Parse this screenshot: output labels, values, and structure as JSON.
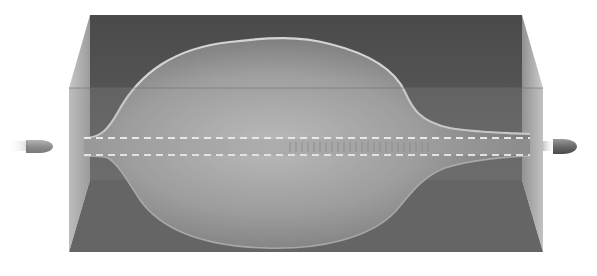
{
  "figure": {
    "elements": {
      "gel_block": "ballistic-gel-block",
      "temporary_cavity": "temporary-cavity-outline",
      "permanent_channel": "permanent-wound-channel",
      "bullet_entry": "bullet-entering",
      "bullet_exit": "bullet-exiting"
    },
    "colors": {
      "background": "#ffffff",
      "block_back": "#5a5a5a",
      "block_front": "#8e8e8e",
      "floor": "#555555",
      "side_left": "#a8a8a8",
      "side_right": "#b4b4b4",
      "cavity_outline": "#d6d6d6",
      "cavity_fill_light": "#c6c6c6",
      "channel_dash": "#e6e6e6",
      "bullet": "#7a7a7a"
    }
  }
}
